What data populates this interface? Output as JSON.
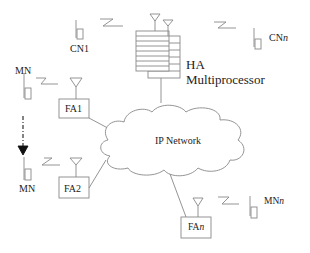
{
  "diagram": {
    "type": "network-architecture",
    "nodes": {
      "ha": {
        "line1": "HA",
        "line2": "Multiprocessor"
      },
      "cn1": {
        "label": "CN1"
      },
      "cnn": {
        "label_main": "CN",
        "label_sub": "n"
      },
      "mn_top": {
        "label": "MN"
      },
      "mn_bottom": {
        "label": "MN"
      },
      "mnn": {
        "label_main": "MN",
        "label_sub": "n"
      },
      "fa1": {
        "label": "FA1"
      },
      "fa2": {
        "label": "FA2"
      },
      "fan": {
        "label_main": "FA",
        "label_sub": "n"
      },
      "network": {
        "label": "IP Network"
      }
    },
    "colors": {
      "stroke": "#888888",
      "text": "#222222",
      "background": "#ffffff"
    }
  }
}
